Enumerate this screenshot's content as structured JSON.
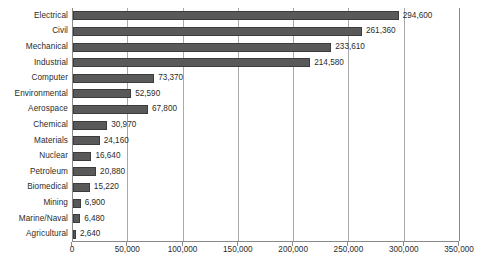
{
  "chart_data": {
    "type": "bar",
    "orientation": "horizontal",
    "title": "",
    "xlabel": "",
    "ylabel": "",
    "xlim": [
      0,
      350000
    ],
    "xticks": [
      "0",
      "50,000",
      "100,000",
      "150,000",
      "200,000",
      "250,000",
      "300,000",
      "350,000"
    ],
    "xtick_values": [
      0,
      50000,
      100000,
      150000,
      200000,
      250000,
      300000,
      350000
    ],
    "grid": "vertical",
    "legend": "none",
    "bar_color": "#595959",
    "bar_border_color": "#3c3c3c",
    "categories": [
      "Electrical",
      "Civil",
      "Mechanical",
      "Industrial",
      "Computer",
      "Environmental",
      "Aerospace",
      "Chemical",
      "Materials",
      "Nuclear",
      "Petroleum",
      "Biomedical",
      "Mining",
      "Marine/Naval",
      "Agricultural"
    ],
    "values": [
      294600,
      261360,
      233610,
      214580,
      73370,
      52590,
      67800,
      30970,
      24160,
      16640,
      20880,
      15220,
      6900,
      6480,
      2640
    ],
    "value_labels": [
      "294,600",
      "261,360",
      "233,610",
      "214,580",
      "73,370",
      "52,590",
      "67,800",
      "30,970",
      "24,160",
      "16,640",
      "20,880",
      "15,220",
      "6,900",
      "6,480",
      "2,640"
    ]
  }
}
